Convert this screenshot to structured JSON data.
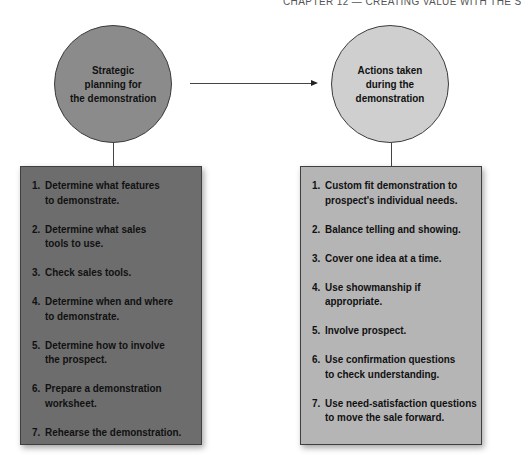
{
  "header": {
    "running_title": "CHAPTER 12 — CREATING VALUE WITH THE S"
  },
  "colors": {
    "left_circle": "#8b8b8b",
    "right_circle": "#cfcfcf",
    "left_box": "#6d6d6d",
    "right_box": "#b5b5b5"
  },
  "diagram": {
    "left": {
      "circle_label": "Strategic\nplanning for\nthe demonstration",
      "items": [
        {
          "num": "1.",
          "text": "Determine what features\nto demonstrate."
        },
        {
          "num": "2.",
          "text": "Determine what sales\ntools to use."
        },
        {
          "num": "3.",
          "text": "Check sales tools."
        },
        {
          "num": "4.",
          "text": "Determine when and where\nto demonstrate."
        },
        {
          "num": "5.",
          "text": "Determine how to involve\nthe prospect."
        },
        {
          "num": "6.",
          "text": "Prepare a demonstration\nworksheet."
        },
        {
          "num": "7.",
          "text": "Rehearse the demonstration."
        }
      ]
    },
    "right": {
      "circle_label": "Actions taken\nduring the\ndemonstration",
      "items": [
        {
          "num": "1.",
          "text": "Custom fit demonstration to\nprospect's individual needs."
        },
        {
          "num": "2.",
          "text": "Balance telling and showing."
        },
        {
          "num": "3.",
          "text": "Cover one idea at a time."
        },
        {
          "num": "4.",
          "text": "Use showmanship if\nappropriate."
        },
        {
          "num": "5.",
          "text": "Involve prospect."
        },
        {
          "num": "6.",
          "text": "Use confirmation questions\nto check understanding."
        },
        {
          "num": "7.",
          "text": "Use need-satisfaction questions\nto move the sale forward."
        }
      ]
    }
  }
}
